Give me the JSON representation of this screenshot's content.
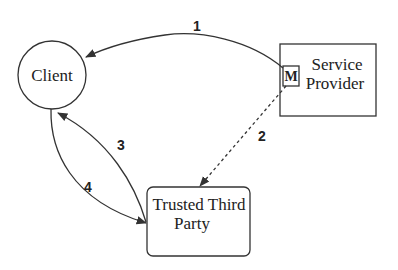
{
  "diagram": {
    "nodes": {
      "client": {
        "label": "Client",
        "shape": "circle"
      },
      "service_provider": {
        "label_line1": "Service",
        "label_line2": "Provider",
        "shape": "rectangle",
        "inner_box_label": "M"
      },
      "trusted_third_party": {
        "label_line1": "Trusted Third",
        "label_line2": "Party",
        "shape": "rounded-rectangle"
      }
    },
    "edges": [
      {
        "label": "1",
        "from": "Service Provider",
        "to": "Client",
        "style": "solid"
      },
      {
        "label": "2",
        "from": "Service Provider",
        "to": "Trusted Third Party",
        "style": "dashed"
      },
      {
        "label": "3",
        "from": "Trusted Third Party",
        "to": "Client",
        "style": "solid"
      },
      {
        "label": "4",
        "from": "Client",
        "to": "Trusted Third Party",
        "style": "solid"
      }
    ]
  },
  "colors": {
    "stroke": "#333333",
    "background": "#ffffff"
  }
}
